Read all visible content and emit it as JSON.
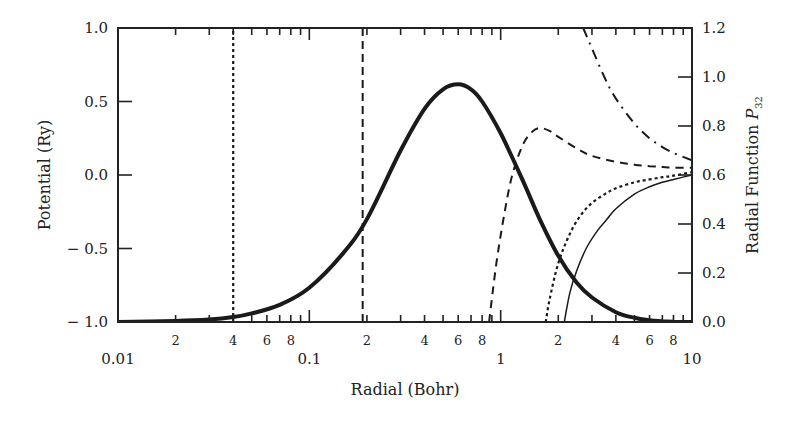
{
  "chart_data": {
    "type": "line",
    "title": "",
    "xlabel": "Radial (Bohr)",
    "ylabel_left": "Potential (Ry)",
    "ylabel_right": "Radial Function P32",
    "ylabel_right_main": "Radial Function ",
    "ylabel_right_symbol": "P",
    "ylabel_right_subscript": "32",
    "xscale": "log",
    "xlim": [
      0.01,
      10
    ],
    "ylim_left": [
      -1.0,
      1.0
    ],
    "ylim_right": [
      0.0,
      1.2
    ],
    "x_major_ticks": [
      "0.01",
      "0.1",
      "1",
      "10"
    ],
    "x_minor_tick_labels": [
      "2",
      "4",
      "6",
      "8"
    ],
    "y_left_ticks": [
      "1.0",
      "0.5",
      "0.0",
      "-0.5",
      "-1.0"
    ],
    "y_right_ticks": [
      "1.2",
      "1.0",
      "0.8",
      "0.6",
      "0.4",
      "0.2",
      "0.0"
    ],
    "grid": false,
    "legend": "none",
    "series": [
      {
        "name": "Radial function P32 (thick solid, right axis)",
        "axis": "right",
        "style": "thick-solid",
        "x": [
          0.01,
          0.02,
          0.03,
          0.04,
          0.05,
          0.07,
          0.1,
          0.15,
          0.2,
          0.3,
          0.4,
          0.5,
          0.6,
          0.7,
          0.8,
          1.0,
          1.3,
          1.6,
          2.0,
          2.5,
          3.0,
          4.0,
          5.0,
          6.0,
          7.0,
          8.0,
          10.0
        ],
        "values": [
          0.0,
          0.004,
          0.01,
          0.02,
          0.035,
          0.07,
          0.14,
          0.28,
          0.42,
          0.7,
          0.87,
          0.95,
          0.97,
          0.95,
          0.9,
          0.77,
          0.58,
          0.42,
          0.27,
          0.16,
          0.1,
          0.04,
          0.017,
          0.007,
          0.003,
          0.001,
          0.0
        ]
      },
      {
        "name": "Vertical dotted marker",
        "axis": "left",
        "style": "dotted-vertical",
        "x": [
          0.04,
          0.04
        ],
        "values": [
          -1.0,
          1.0
        ]
      },
      {
        "name": "Vertical dashed marker",
        "axis": "left",
        "style": "dashed-vertical",
        "x": [
          0.19,
          0.19
        ],
        "values": [
          -1.0,
          1.0
        ]
      },
      {
        "name": "Potential (dashed, left axis)",
        "axis": "left",
        "style": "dashed",
        "x": [
          0.87,
          0.95,
          1.05,
          1.15,
          1.3,
          1.45,
          1.6,
          1.8,
          2.0,
          2.5,
          3.0,
          4.0,
          5.0,
          6.0,
          7.0,
          8.0,
          10.0
        ],
        "values": [
          -1.0,
          -0.6,
          -0.25,
          0.0,
          0.2,
          0.29,
          0.32,
          0.3,
          0.26,
          0.18,
          0.13,
          0.09,
          0.07,
          0.06,
          0.055,
          0.05,
          0.05
        ]
      },
      {
        "name": "Potential (dash-dot, left axis)",
        "axis": "left",
        "style": "dash-dot",
        "x": [
          2.7,
          3.0,
          3.5,
          4.0,
          5.0,
          6.0,
          7.0,
          8.0,
          10.0
        ],
        "values": [
          1.0,
          0.86,
          0.66,
          0.52,
          0.35,
          0.25,
          0.19,
          0.15,
          0.1
        ]
      },
      {
        "name": "Potential (dotted, left axis)",
        "axis": "left",
        "style": "dotted",
        "x": [
          1.72,
          1.8,
          2.0,
          2.3,
          2.6,
          3.0,
          3.5,
          4.0,
          5.0,
          6.0,
          7.0,
          8.0,
          10.0
        ],
        "values": [
          -1.0,
          -0.85,
          -0.6,
          -0.4,
          -0.28,
          -0.19,
          -0.13,
          -0.09,
          -0.05,
          -0.03,
          -0.015,
          -0.005,
          0.02
        ]
      },
      {
        "name": "Potential (thin solid, left axis)",
        "axis": "left",
        "style": "thin-solid",
        "x": [
          2.15,
          2.3,
          2.5,
          2.8,
          3.2,
          3.6,
          4.0,
          5.0,
          6.0,
          7.0,
          8.0,
          10.0
        ],
        "values": [
          -1.0,
          -0.8,
          -0.65,
          -0.5,
          -0.38,
          -0.3,
          -0.23,
          -0.13,
          -0.08,
          -0.05,
          -0.03,
          0.0
        ]
      }
    ]
  },
  "labels": {
    "x_axis_title": "Radial (Bohr)",
    "y_left_title": "Potential (Ry)"
  }
}
